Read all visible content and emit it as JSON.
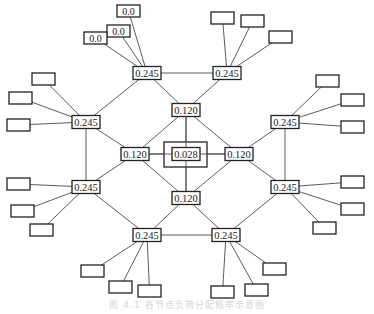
{
  "diagram": {
    "type": "hierarchical-network",
    "center": {
      "label": "0.028",
      "x": 186,
      "y": 154,
      "outer": {
        "x": 164,
        "y": 142,
        "w": 43,
        "h": 25
      }
    },
    "ring_nodes": [
      {
        "id": "r-top",
        "label": "0.120",
        "x": 186,
        "y": 110
      },
      {
        "id": "r-left",
        "label": "0.120",
        "x": 135,
        "y": 154
      },
      {
        "id": "r-right",
        "label": "0.120",
        "x": 239,
        "y": 154
      },
      {
        "id": "r-bottom",
        "label": "0.120",
        "x": 186,
        "y": 198
      }
    ],
    "outer_nodes": [
      {
        "id": "o-tl",
        "label": "0.245",
        "x": 147,
        "y": 73
      },
      {
        "id": "o-tr",
        "label": "0.245",
        "x": 227,
        "y": 73
      },
      {
        "id": "o-lu",
        "label": "0.245",
        "x": 86,
        "y": 122
      },
      {
        "id": "o-ru",
        "label": "0.245",
        "x": 285,
        "y": 122
      },
      {
        "id": "o-ll",
        "label": "0.245",
        "x": 86,
        "y": 187
      },
      {
        "id": "o-rl",
        "label": "0.245",
        "x": 285,
        "y": 187
      },
      {
        "id": "o-bl",
        "label": "0.245",
        "x": 147,
        "y": 235
      },
      {
        "id": "o-br",
        "label": "0.245",
        "x": 226,
        "y": 235
      }
    ],
    "leaves": [
      {
        "parent": "o-tl",
        "label": "0.0",
        "x": 107,
        "y": 25,
        "w": 23,
        "h": 12
      },
      {
        "parent": "o-tl",
        "label": "0.0",
        "x": 117,
        "y": 5,
        "w": 23,
        "h": 12
      },
      {
        "parent": "o-tl",
        "label": "0.0",
        "x": 84,
        "y": 32,
        "w": 23,
        "h": 12
      },
      {
        "parent": "o-tr",
        "label": "",
        "x": 211,
        "y": 12,
        "w": 23,
        "h": 12
      },
      {
        "parent": "o-tr",
        "label": "",
        "x": 241,
        "y": 15,
        "w": 23,
        "h": 12
      },
      {
        "parent": "o-tr",
        "label": "",
        "x": 269,
        "y": 31,
        "w": 23,
        "h": 12
      },
      {
        "parent": "o-lu",
        "label": "",
        "x": 32,
        "y": 73,
        "w": 23,
        "h": 12
      },
      {
        "parent": "o-lu",
        "label": "",
        "x": 9,
        "y": 92,
        "w": 23,
        "h": 12
      },
      {
        "parent": "o-lu",
        "label": "",
        "x": 7,
        "y": 119,
        "w": 23,
        "h": 12
      },
      {
        "parent": "o-ru",
        "label": "",
        "x": 316,
        "y": 75,
        "w": 23,
        "h": 12
      },
      {
        "parent": "o-ru",
        "label": "",
        "x": 341,
        "y": 94,
        "w": 23,
        "h": 12
      },
      {
        "parent": "o-ru",
        "label": "",
        "x": 341,
        "y": 121,
        "w": 23,
        "h": 12
      },
      {
        "parent": "o-ll",
        "label": "",
        "x": 7,
        "y": 178,
        "w": 23,
        "h": 12
      },
      {
        "parent": "o-ll",
        "label": "",
        "x": 11,
        "y": 205,
        "w": 23,
        "h": 12
      },
      {
        "parent": "o-ll",
        "label": "",
        "x": 30,
        "y": 224,
        "w": 23,
        "h": 12
      },
      {
        "parent": "o-rl",
        "label": "",
        "x": 341,
        "y": 176,
        "w": 23,
        "h": 12
      },
      {
        "parent": "o-rl",
        "label": "",
        "x": 341,
        "y": 203,
        "w": 23,
        "h": 12
      },
      {
        "parent": "o-rl",
        "label": "",
        "x": 313,
        "y": 222,
        "w": 23,
        "h": 12
      },
      {
        "parent": "o-bl",
        "label": "",
        "x": 81,
        "y": 265,
        "w": 23,
        "h": 12
      },
      {
        "parent": "o-bl",
        "label": "",
        "x": 109,
        "y": 281,
        "w": 23,
        "h": 12
      },
      {
        "parent": "o-bl",
        "label": "",
        "x": 138,
        "y": 285,
        "w": 23,
        "h": 12
      },
      {
        "parent": "o-br",
        "label": "",
        "x": 263,
        "y": 263,
        "w": 23,
        "h": 12
      },
      {
        "parent": "o-br",
        "label": "",
        "x": 245,
        "y": 284,
        "w": 23,
        "h": 12
      },
      {
        "parent": "o-br",
        "label": "",
        "x": 211,
        "y": 286,
        "w": 23,
        "h": 12
      }
    ],
    "edges": [
      [
        "o-tl",
        "o-tr"
      ],
      [
        "o-tl",
        "o-lu"
      ],
      [
        "o-tl",
        "r-top"
      ],
      [
        "o-tr",
        "r-top"
      ],
      [
        "o-lu",
        "o-ll"
      ],
      [
        "o-lu",
        "r-left"
      ],
      [
        "o-ll",
        "r-left"
      ],
      [
        "o-ll",
        "o-bl"
      ],
      [
        "o-bl",
        "o-br"
      ],
      [
        "o-bl",
        "r-bottom"
      ],
      [
        "o-br",
        "r-bottom"
      ],
      [
        "o-br",
        "o-rl"
      ],
      [
        "o-rl",
        "r-right"
      ],
      [
        "o-rl",
        "o-ru"
      ],
      [
        "o-ru",
        "r-right"
      ],
      [
        "r-top",
        "r-left"
      ],
      [
        "r-top",
        "r-right"
      ],
      [
        "r-bottom",
        "r-left"
      ],
      [
        "r-bottom",
        "r-right"
      ],
      [
        "r-top",
        "center"
      ],
      [
        "r-bottom",
        "center"
      ],
      [
        "r-left",
        "center"
      ],
      [
        "r-right",
        "center"
      ]
    ],
    "node_size": {
      "w": 28,
      "h": 13
    }
  },
  "caption": "图 4.1  各节点负荷分配概率示意图"
}
